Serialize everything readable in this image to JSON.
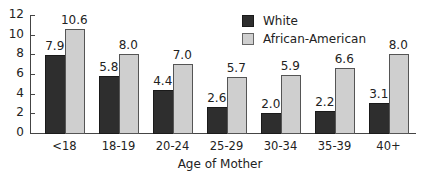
{
  "chart_data": {
    "type": "bar",
    "title": "",
    "xlabel": "Age of Mother",
    "ylabel": "",
    "ylim": [
      0,
      12
    ],
    "yticks": [
      0,
      2,
      4,
      6,
      8,
      10,
      12
    ],
    "grid": false,
    "legend_position": "top-right",
    "categories": [
      "<18",
      "18-19",
      "20-24",
      "25-29",
      "30-34",
      "35-39",
      "40+"
    ],
    "series": [
      {
        "name": "White",
        "color": "#2e2e2e",
        "values": [
          7.9,
          5.8,
          4.4,
          2.6,
          2.0,
          2.2,
          3.1
        ],
        "labels": [
          "7.9",
          "5.8",
          "4.4",
          "2.6",
          "2.0",
          "2.2",
          "3.1"
        ]
      },
      {
        "name": "African-American",
        "color": "#cfcfcf",
        "values": [
          10.6,
          8.0,
          7.0,
          5.7,
          5.9,
          6.6,
          8.0
        ],
        "labels": [
          "10.6",
          "8.0",
          "7.0",
          "5.7",
          "5.9",
          "6.6",
          "8.0"
        ]
      }
    ]
  },
  "legend": {
    "items": [
      {
        "label": "White",
        "color": "#2e2e2e"
      },
      {
        "label": "African-American",
        "color": "#cfcfcf"
      }
    ]
  }
}
